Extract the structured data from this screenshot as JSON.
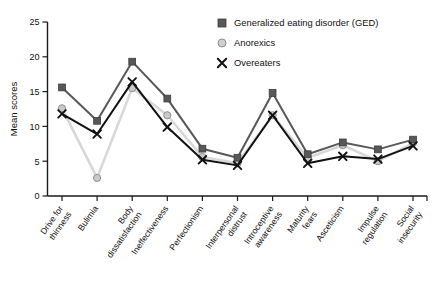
{
  "chart_data": {
    "type": "line",
    "title": "",
    "xlabel": "",
    "ylabel": "Mean scores",
    "ylim": [
      0,
      25
    ],
    "yticks": [
      0,
      5,
      10,
      15,
      20,
      25
    ],
    "grid": false,
    "legend_position": "top-right",
    "categories": [
      "Drive for thinness",
      "Bulimia",
      "Body dissatisfaction",
      "Ineffectiveness",
      "Perfectionism",
      "Interpersonal distrust",
      "Introceptive awareness",
      "Maturity fears",
      "Asceticism",
      "Impulse regulation",
      "Social insecurity"
    ],
    "categories_lines": [
      [
        "Drive for",
        "thinness"
      ],
      [
        "Bulimia"
      ],
      [
        "Body",
        "dissatisfaction"
      ],
      [
        "Ineffectiveness"
      ],
      [
        "Perfectionism"
      ],
      [
        "Interpersonal",
        "distrust"
      ],
      [
        "Introceptive",
        "awareness"
      ],
      [
        "Maturity",
        "fears"
      ],
      [
        "Asceticism"
      ],
      [
        "Impulse",
        "regulation"
      ],
      [
        "Social",
        "insecurity"
      ]
    ],
    "series": [
      {
        "name": "Generalized eating disorder (GED)",
        "marker": "square",
        "color": "#585858",
        "line_color": "#585858",
        "values": [
          15.6,
          10.8,
          19.3,
          14.0,
          6.8,
          5.5,
          14.8,
          6.0,
          7.7,
          6.7,
          8.1
        ]
      },
      {
        "name": "Anorexics",
        "marker": "circle",
        "color": "#c9c9c9",
        "line_color": "#d8d8d8",
        "values": [
          12.6,
          2.6,
          15.5,
          11.6,
          5.6,
          4.7,
          11.6,
          5.5,
          7.3,
          5.0,
          7.6
        ]
      },
      {
        "name": "Overeaters",
        "marker": "cross",
        "color": "#111111",
        "line_color": "#111111",
        "values": [
          11.8,
          8.9,
          16.4,
          9.9,
          5.2,
          4.4,
          11.6,
          4.7,
          5.7,
          5.3,
          7.2
        ]
      }
    ]
  },
  "legend": {
    "items": [
      {
        "label": "Generalized eating disorder (GED)",
        "marker": "square"
      },
      {
        "label": "Anorexics",
        "marker": "circle"
      },
      {
        "label": "Overeaters",
        "marker": "cross"
      }
    ]
  },
  "axis": {
    "y_title": "Mean scores",
    "y_tick_labels": [
      "0",
      "5",
      "10",
      "15",
      "20",
      "25"
    ]
  }
}
